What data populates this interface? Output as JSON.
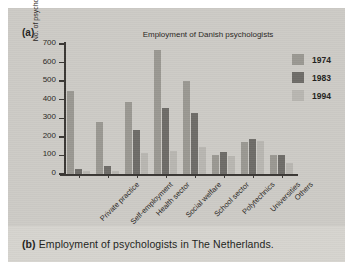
{
  "figure": {
    "panel_label": "(a)",
    "caption_label": "(b)",
    "caption_text": "Employment of psychologists in The Netherlands."
  },
  "colors": {
    "series_1974": "#9a9892",
    "series_1983": "#6e6c68",
    "series_1994": "#b8b6b1",
    "axis": "#3a3734",
    "panel_bg": "#cdcbc6",
    "caption_bg": "#d6d4cf",
    "text": "#231f20"
  },
  "chart_data": {
    "type": "bar",
    "title": "Employment of Danish psychologists",
    "xlabel": "",
    "ylabel": "No. of psychologists",
    "ylim": [
      0,
      700
    ],
    "yticks": [
      0,
      100,
      200,
      300,
      400,
      500,
      600,
      700
    ],
    "ytick_labels": [
      "0",
      "100",
      "200",
      "300",
      "400",
      "500",
      "600",
      "700"
    ],
    "grid": false,
    "legend_position": "upper right",
    "categories": [
      "Private practice",
      "Self-employment",
      "Health sector",
      "Social welfare",
      "School sector",
      "Polytechnics",
      "Universities",
      "Others"
    ],
    "series": [
      {
        "name": "1974",
        "color": "#9a9892",
        "values": [
          445,
          280,
          390,
          670,
          500,
          100,
          175,
          105
        ]
      },
      {
        "name": "1983",
        "color": "#6e6c68",
        "values": [
          25,
          45,
          235,
          355,
          330,
          120,
          190,
          100
        ]
      },
      {
        "name": "1994",
        "color": "#b8b6b1",
        "values": [
          15,
          15,
          115,
          125,
          145,
          95,
          180,
          60
        ]
      }
    ]
  }
}
